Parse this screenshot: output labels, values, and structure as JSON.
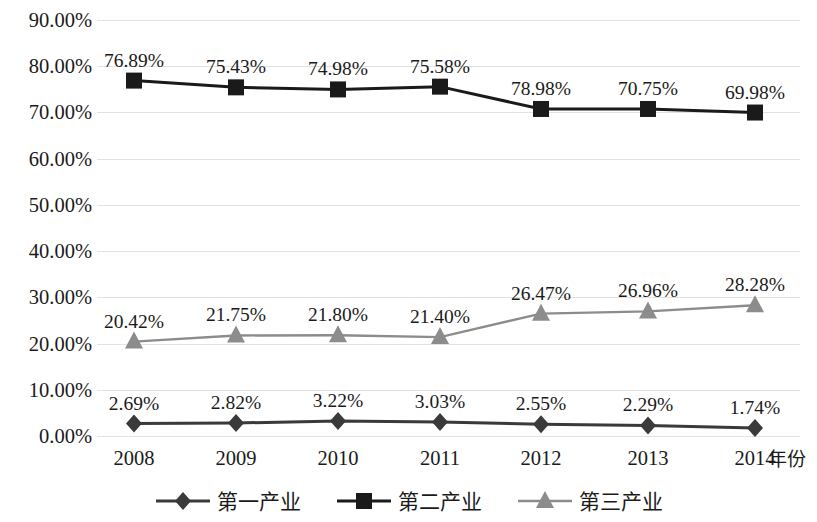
{
  "chart_data": {
    "type": "line",
    "title": "",
    "xlabel": "年份",
    "ylabel": "",
    "categories": [
      "2008",
      "2009",
      "2010",
      "2011",
      "2012",
      "2013",
      "2014"
    ],
    "ylim": [
      0,
      90
    ],
    "ytick_labels": [
      "0.00%",
      "10.00%",
      "20.00%",
      "30.00%",
      "40.00%",
      "50.00%",
      "60.00%",
      "70.00%",
      "80.00%",
      "90.00%"
    ],
    "ytick_values": [
      0,
      10,
      20,
      30,
      40,
      50,
      60,
      70,
      80,
      90
    ],
    "grid": true,
    "legend_position": "bottom",
    "series": [
      {
        "name": "第一产业",
        "marker": "diamond",
        "color": "#3a3a3a",
        "values": [
          2.69,
          2.82,
          3.22,
          3.03,
          2.55,
          2.29,
          1.74
        ],
        "labels": [
          "2.69%",
          "2.82%",
          "3.22%",
          "3.03%",
          "2.55%",
          "2.29%",
          "1.74%"
        ]
      },
      {
        "name": "第二产业",
        "marker": "square",
        "color": "#1a1a1a",
        "values": [
          76.89,
          75.43,
          74.98,
          75.58,
          70.75,
          70.75,
          69.98
        ],
        "labels": [
          "76.89%",
          "75.43%",
          "74.98%",
          "75.58%",
          "78.98%",
          "70.75%",
          "69.98%"
        ]
      },
      {
        "name": "第三产业",
        "marker": "triangle",
        "color": "#8c8c8c",
        "values": [
          20.42,
          21.75,
          21.8,
          21.4,
          26.47,
          26.96,
          28.28
        ],
        "labels": [
          "20.42%",
          "21.75%",
          "21.80%",
          "21.40%",
          "26.47%",
          "26.96%",
          "28.28%"
        ]
      }
    ]
  }
}
